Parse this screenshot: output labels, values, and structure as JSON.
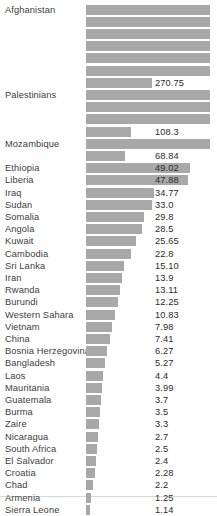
{
  "chart_data": {
    "type": "bar",
    "title": "",
    "subtitle": "",
    "xlabel": "",
    "ylabel": "",
    "orientation": "horizontal",
    "grid": false,
    "legend": null,
    "axis_visible": false,
    "note": "Top six bars are unlabeled and clipped at the right edge of the plot area; bar lengths are drawn on a compressed scale so they are not strictly proportional to the printed values.",
    "bar_color": "#a8a8a8",
    "label_color": "#3d3d3d",
    "value_color": "#2b2b2b",
    "background": "#ffffff",
    "value_range": [
      1.14,
      270.75
    ],
    "rows": [
      {
        "category": "Afghanistan",
        "value": "",
        "bar_px": 124,
        "clipped": true
      },
      {
        "category": "",
        "value": "",
        "bar_px": 124,
        "clipped": true
      },
      {
        "category": "",
        "value": "",
        "bar_px": 124,
        "clipped": true
      },
      {
        "category": "",
        "value": "",
        "bar_px": 124,
        "clipped": true
      },
      {
        "category": "",
        "value": "",
        "bar_px": 124,
        "clipped": true
      },
      {
        "category": "",
        "value": "",
        "bar_px": 124,
        "clipped": true
      },
      {
        "category": "",
        "value": "270.75",
        "bar_px": 66,
        "clipped": false
      },
      {
        "category": "Palestinians",
        "value": "",
        "bar_px": 124,
        "clipped": true
      },
      {
        "category": "",
        "value": "",
        "bar_px": 124,
        "clipped": true
      },
      {
        "category": "",
        "value": "",
        "bar_px": 124,
        "clipped": true
      },
      {
        "category": "",
        "value": "108.3",
        "bar_px": 45,
        "clipped": false
      },
      {
        "category": "Mozambique",
        "value": "",
        "bar_px": 124,
        "clipped": true
      },
      {
        "category": "",
        "value": "68.84",
        "bar_px": 39,
        "clipped": false
      },
      {
        "category": "Ethiopia",
        "value": "49.02",
        "bar_px": 104,
        "clipped": false
      },
      {
        "category": "Liberia",
        "value": "47.88",
        "bar_px": 102,
        "clipped": false
      },
      {
        "category": "Iraq",
        "value": "34.77",
        "bar_px": 68,
        "clipped": false
      },
      {
        "category": "Sudan",
        "value": "33.0",
        "bar_px": 66,
        "clipped": false
      },
      {
        "category": "Somalia",
        "value": "29.8",
        "bar_px": 58,
        "clipped": false
      },
      {
        "category": "Angola",
        "value": "28.5",
        "bar_px": 56,
        "clipped": false
      },
      {
        "category": "Kuwait",
        "value": "25.65",
        "bar_px": 50,
        "clipped": false
      },
      {
        "category": "Cambodia",
        "value": "22.8",
        "bar_px": 45,
        "clipped": false
      },
      {
        "category": "Sri Lanka",
        "value": "15.10",
        "bar_px": 38,
        "clipped": false
      },
      {
        "category": "Iran",
        "value": "13.9",
        "bar_px": 36,
        "clipped": false
      },
      {
        "category": "Rwanda",
        "value": "13.11",
        "bar_px": 34,
        "clipped": false
      },
      {
        "category": "Burundi",
        "value": "12.25",
        "bar_px": 32,
        "clipped": false
      },
      {
        "category": "Western Sahara",
        "value": "10.83",
        "bar_px": 29,
        "clipped": false
      },
      {
        "category": "Vietnam",
        "value": "7.98",
        "bar_px": 26,
        "clipped": false
      },
      {
        "category": "China",
        "value": "7.41",
        "bar_px": 24,
        "clipped": false
      },
      {
        "category": "Bosnia Herzegovina",
        "value": "6.27",
        "bar_px": 21,
        "clipped": false
      },
      {
        "category": "Bangladesh",
        "value": "5.27",
        "bar_px": 19,
        "clipped": false
      },
      {
        "category": "Laos",
        "value": "4.4",
        "bar_px": 17,
        "clipped": false
      },
      {
        "category": "Mauritania",
        "value": "3.99",
        "bar_px": 16,
        "clipped": false
      },
      {
        "category": "Guatemala",
        "value": "3.7",
        "bar_px": 15,
        "clipped": false
      },
      {
        "category": "Burma",
        "value": "3.5",
        "bar_px": 14,
        "clipped": false
      },
      {
        "category": "Zaire",
        "value": "3.3",
        "bar_px": 13,
        "clipped": false
      },
      {
        "category": "Nicaragua",
        "value": "2.7",
        "bar_px": 12,
        "clipped": false
      },
      {
        "category": "South Africa",
        "value": "2.5",
        "bar_px": 11,
        "clipped": false
      },
      {
        "category": "El Salvador",
        "value": "2.4",
        "bar_px": 10,
        "clipped": false
      },
      {
        "category": "Croatia",
        "value": "2.28",
        "bar_px": 9,
        "clipped": false
      },
      {
        "category": "Chad",
        "value": "2.2",
        "bar_px": 7,
        "clipped": false
      },
      {
        "category": "Armenia",
        "value": "1.25",
        "bar_px": 5,
        "clipped": false
      },
      {
        "category": "Sierra Leone",
        "value": "1.14",
        "bar_px": 4,
        "clipped": false
      }
    ]
  }
}
